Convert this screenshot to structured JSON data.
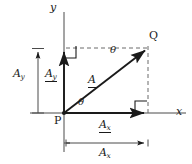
{
  "figure": {
    "background": "#ffffff",
    "stroke_color": "#1a1a1a",
    "dash_color": "#555555",
    "width": 192,
    "height": 164
  },
  "axes": {
    "x_label": "x",
    "y_label": "y",
    "origin_label": "P",
    "origin": {
      "x": 64,
      "y": 113
    },
    "x_axis": {
      "x1": 30,
      "y1": 113,
      "x2": 186,
      "y2": 113
    },
    "y_axis": {
      "x1": 64,
      "y1": 12,
      "x2": 64,
      "y2": 152
    }
  },
  "points": [
    {
      "name": "P",
      "label": "P",
      "x": 64,
      "y": 113
    },
    {
      "name": "Q",
      "label": "Q",
      "x": 148,
      "y": 48
    }
  ],
  "vectors": [
    {
      "name": "resultant",
      "label": "A",
      "notation": "underlined",
      "from": {
        "x": 64,
        "y": 113
      },
      "to": {
        "x": 148,
        "y": 48
      },
      "label_pos": {
        "x": 88,
        "y": 75
      }
    },
    {
      "name": "x-component",
      "label": "A",
      "subscript": "x",
      "notation": "underlined",
      "from": {
        "x": 64,
        "y": 113
      },
      "to": {
        "x": 148,
        "y": 113
      },
      "label_pos": {
        "x": 99,
        "y": 119
      }
    },
    {
      "name": "y-component",
      "label": "A",
      "subscript": "y",
      "notation": "underlined",
      "from": {
        "x": 64,
        "y": 113
      },
      "to": {
        "x": 64,
        "y": 48
      },
      "label_pos": {
        "x": 46,
        "y": 69
      }
    }
  ],
  "dimensions": [
    {
      "name": "A_y magnitude",
      "label": "A",
      "subscript": "y",
      "orientation": "vertical",
      "line": {
        "x1": 38,
        "y1": 48,
        "x2": 38,
        "y2": 113
      },
      "label_pos": {
        "x": 13,
        "y": 69
      }
    },
    {
      "name": "A_x magnitude",
      "label": "A",
      "subscript": "x",
      "orientation": "horizontal",
      "line": {
        "x1": 64,
        "y1": 143,
        "x2": 148,
        "y2": 143
      },
      "label_pos": {
        "x": 99,
        "y": 147
      }
    }
  ],
  "angles": [
    {
      "name": "theta-at-origin",
      "label": "θ",
      "x": 78,
      "y": 98
    },
    {
      "name": "theta-at-Q",
      "label": "θ",
      "x": 110,
      "y": 45
    }
  ],
  "right_angles": [
    {
      "name": "top-left-right-angle",
      "x": 64,
      "y": 48,
      "corner": "bottom-left"
    },
    {
      "name": "bottom-right-right-angle",
      "x": 148,
      "y": 113,
      "corner": "top-left"
    }
  ],
  "dashed_lines": [
    {
      "name": "horizontal-projection",
      "x1": 64,
      "y1": 48,
      "x2": 148,
      "y2": 48
    },
    {
      "name": "vertical-projection",
      "x1": 148,
      "y1": 48,
      "x2": 148,
      "y2": 113
    }
  ]
}
